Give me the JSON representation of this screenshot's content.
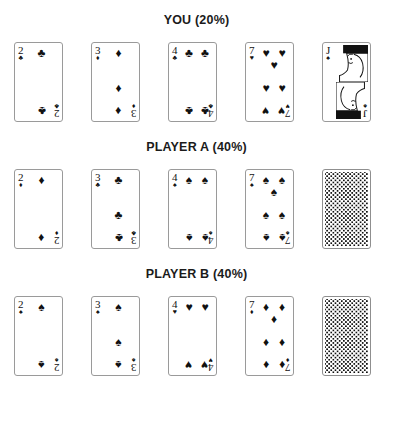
{
  "title_suffix": "%",
  "colors": {
    "ink": "#111111",
    "card_border": "#9a9a9a",
    "background": "#ffffff",
    "back_pattern": "#111111"
  },
  "suit_glyphs": {
    "spades": "♠",
    "hearts": "♥",
    "diamonds": "♦",
    "clubs": "♣"
  },
  "players": [
    {
      "name": "YOU",
      "probability": "20%",
      "heading": "YOU (20%)",
      "cards": [
        {
          "rank": "2",
          "suit": "clubs",
          "suit_glyph": "♣",
          "label": "2 of Clubs",
          "face_down": false,
          "court": false,
          "pip_count": 2
        },
        {
          "rank": "3",
          "suit": "diamonds",
          "suit_glyph": "♦",
          "label": "3 of Diamonds",
          "face_down": false,
          "court": false,
          "pip_count": 3
        },
        {
          "rank": "4",
          "suit": "clubs",
          "suit_glyph": "♣",
          "label": "4 of Clubs",
          "face_down": false,
          "court": false,
          "pip_count": 4
        },
        {
          "rank": "7",
          "suit": "hearts",
          "suit_glyph": "♥",
          "label": "7 of Hearts",
          "face_down": false,
          "court": false,
          "pip_count": 7
        },
        {
          "rank": "J",
          "suit": "spades",
          "suit_glyph": "♠",
          "label": "Jack of Spades",
          "face_down": false,
          "court": true,
          "pip_count": 0
        }
      ]
    },
    {
      "name": "PLAYER A",
      "probability": "40%",
      "heading": "PLAYER A (40%)",
      "cards": [
        {
          "rank": "2",
          "suit": "diamonds",
          "suit_glyph": "♦",
          "label": "2 of Diamonds",
          "face_down": false,
          "court": false,
          "pip_count": 2
        },
        {
          "rank": "3",
          "suit": "clubs",
          "suit_glyph": "♣",
          "label": "3 of Clubs",
          "face_down": false,
          "court": false,
          "pip_count": 3
        },
        {
          "rank": "4",
          "suit": "spades",
          "suit_glyph": "♠",
          "label": "4 of Spades",
          "face_down": false,
          "court": false,
          "pip_count": 4
        },
        {
          "rank": "7",
          "suit": "spades",
          "suit_glyph": "♠",
          "label": "7 of Spades",
          "face_down": false,
          "court": false,
          "pip_count": 7
        },
        {
          "rank": "",
          "suit": "back",
          "suit_glyph": "",
          "label": "Face-down card",
          "face_down": true,
          "court": false,
          "pip_count": 0
        }
      ]
    },
    {
      "name": "PLAYER B",
      "probability": "40%",
      "heading": "PLAYER B (40%)",
      "cards": [
        {
          "rank": "2",
          "suit": "spades",
          "suit_glyph": "♠",
          "label": "2 of Spades",
          "face_down": false,
          "court": false,
          "pip_count": 2
        },
        {
          "rank": "3",
          "suit": "spades",
          "suit_glyph": "♠",
          "label": "3 of Spades",
          "face_down": false,
          "court": false,
          "pip_count": 3
        },
        {
          "rank": "4",
          "suit": "hearts",
          "suit_glyph": "♥",
          "label": "4 of Hearts",
          "face_down": false,
          "court": false,
          "pip_count": 4
        },
        {
          "rank": "7",
          "suit": "diamonds",
          "suit_glyph": "♦",
          "label": "7 of Diamonds",
          "face_down": false,
          "court": false,
          "pip_count": 7
        },
        {
          "rank": "",
          "suit": "back",
          "suit_glyph": "",
          "label": "Face-down card",
          "face_down": true,
          "court": false,
          "pip_count": 0
        }
      ]
    }
  ]
}
